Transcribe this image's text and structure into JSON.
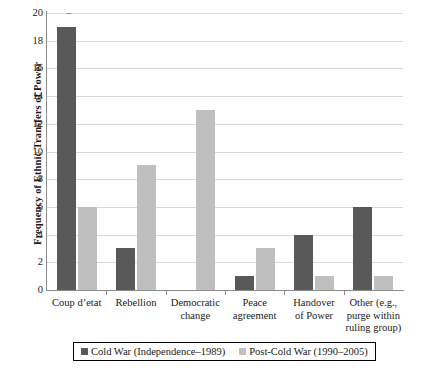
{
  "chart_data": {
    "type": "bar",
    "title": "",
    "xlabel": "",
    "ylabel": "Frequency of Ethnic Transfers of Power",
    "ylim": [
      0,
      20
    ],
    "ytick_step": 2,
    "yticks": [
      20,
      18,
      16,
      14,
      12,
      10,
      8,
      6,
      4,
      2,
      0
    ],
    "grid": true,
    "legend_position": "bottom",
    "categories": [
      "Coup d’etat",
      "Rebellion",
      "Democratic change",
      "Peace agreement",
      "Handover of Power",
      "Other (e.g., purge within ruling group)"
    ],
    "category_lines": [
      [
        "Coup d’etat"
      ],
      [
        "Rebellion"
      ],
      [
        "Democratic",
        "change"
      ],
      [
        "Peace",
        "agreement"
      ],
      [
        "Handover",
        "of Power"
      ],
      [
        "Other (e.g.,",
        "purge within",
        "ruling group)"
      ]
    ],
    "series": [
      {
        "name": "Cold War (Independence–1989)",
        "color": "#595959",
        "values": [
          19,
          3,
          0,
          1,
          4,
          6
        ]
      },
      {
        "name": "Post-Cold War (1990–2005)",
        "color": "#bfbfbf",
        "values": [
          6,
          9,
          13,
          3,
          1,
          1
        ]
      }
    ]
  },
  "legend": {
    "items": [
      {
        "label": "Cold War (Independence–1989)",
        "color": "#595959"
      },
      {
        "label": "Post-Cold War (1990–2005)",
        "color": "#bfbfbf"
      }
    ]
  },
  "colors": {
    "cold_war": "#595959",
    "post_cold_war": "#bfbfbf",
    "grid": "#d9d9d9",
    "axis": "#8c8c8c",
    "text": "#1a1a1a"
  }
}
